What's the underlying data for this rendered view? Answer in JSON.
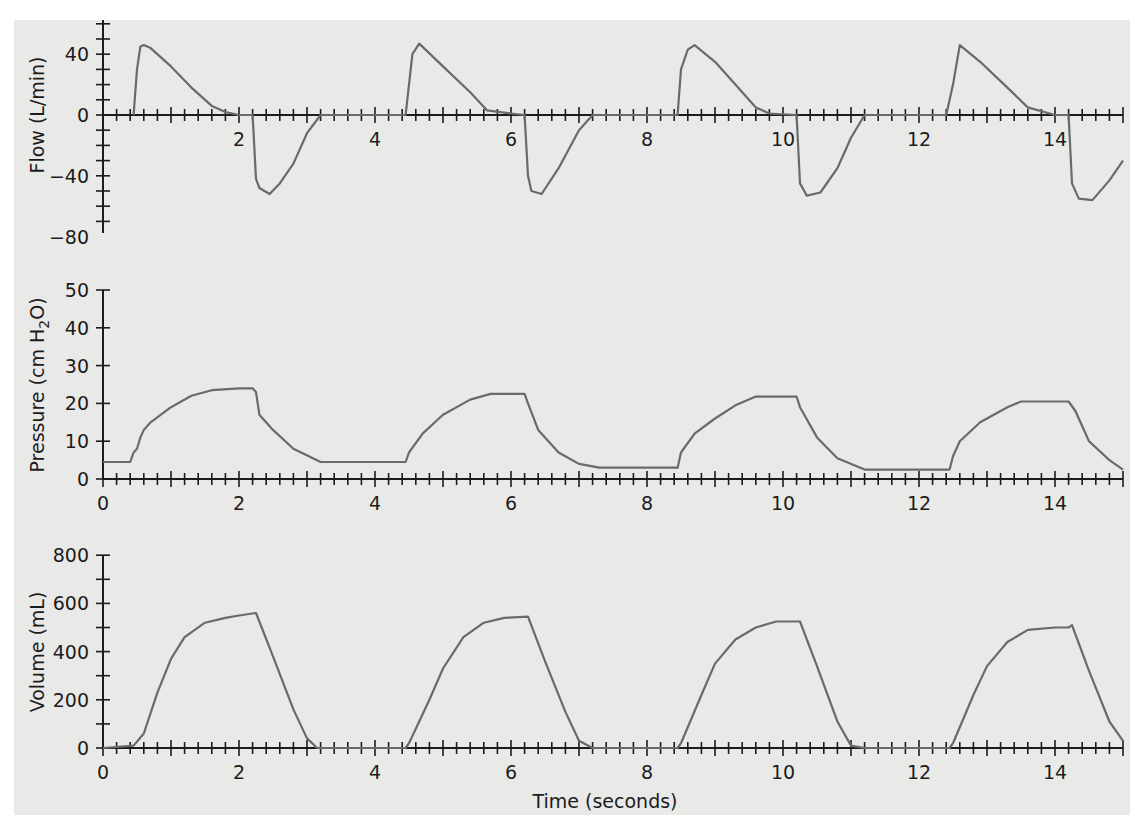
{
  "chart_data": [
    {
      "type": "line",
      "title": "",
      "xlabel": "",
      "ylabel": "Flow (L/min)",
      "ylim": [
        -80,
        60
      ],
      "xlim": [
        0,
        15
      ],
      "yticks": [
        40,
        0,
        -40,
        -80
      ],
      "xticks": [
        2,
        4,
        6,
        8,
        10,
        12,
        14
      ],
      "grid": false,
      "series": [
        {
          "name": "Flow",
          "x": [
            0.45,
            0.5,
            0.55,
            0.6,
            0.7,
            1.0,
            1.3,
            1.6,
            1.8,
            2.0,
            2.2,
            2.25,
            2.3,
            2.45,
            2.6,
            2.8,
            3.0,
            3.2,
            4.45,
            4.55,
            4.65,
            5.0,
            5.4,
            5.65,
            6.0,
            6.2,
            6.25,
            6.3,
            6.45,
            6.7,
            7.0,
            7.2,
            8.45,
            8.5,
            8.6,
            8.7,
            9.0,
            9.3,
            9.6,
            9.8,
            10.2,
            10.25,
            10.35,
            10.55,
            10.8,
            11.0,
            11.2,
            12.4,
            12.5,
            12.6,
            12.9,
            13.3,
            13.6,
            14.0,
            14.2,
            14.25,
            14.35,
            14.55,
            14.8,
            15.0
          ],
          "y": [
            0,
            30,
            45,
            46,
            44,
            32,
            18,
            6,
            2,
            0,
            0,
            -42,
            -48,
            -52,
            -45,
            -32,
            -12,
            0,
            0,
            40,
            47,
            32,
            15,
            3,
            1,
            0,
            -40,
            -50,
            -52,
            -35,
            -10,
            0,
            0,
            30,
            43,
            46,
            35,
            20,
            5,
            1,
            0,
            -45,
            -53,
            -51,
            -35,
            -15,
            0,
            0,
            20,
            46,
            35,
            18,
            5,
            0,
            0,
            -45,
            -55,
            -56,
            -43,
            -30
          ]
        }
      ]
    },
    {
      "type": "line",
      "title": "",
      "xlabel": "",
      "ylabel": "Pressure (cm H2O)",
      "ylim": [
        0,
        50
      ],
      "xlim": [
        0,
        15
      ],
      "yticks": [
        0,
        10,
        20,
        30,
        40,
        50
      ],
      "xticks": [
        0,
        2,
        4,
        6,
        8,
        10,
        12,
        14
      ],
      "grid": false,
      "series": [
        {
          "name": "Pressure",
          "x": [
            0,
            0.4,
            0.45,
            0.5,
            0.55,
            0.6,
            0.7,
            1.0,
            1.3,
            1.6,
            2.0,
            2.2,
            2.25,
            2.3,
            2.5,
            2.8,
            3.2,
            4.45,
            4.5,
            4.7,
            5.0,
            5.4,
            5.7,
            6.2,
            6.25,
            6.4,
            6.7,
            7.0,
            7.3,
            8.45,
            8.5,
            8.7,
            9.0,
            9.3,
            9.6,
            10.2,
            10.25,
            10.5,
            10.8,
            11.2,
            12.45,
            12.5,
            12.6,
            12.9,
            13.3,
            13.5,
            14.2,
            14.3,
            14.5,
            14.8,
            15.0
          ],
          "y": [
            4.5,
            4.5,
            7,
            8,
            11,
            13,
            15,
            19,
            22,
            23.5,
            24,
            24,
            23,
            17,
            13,
            8,
            4.5,
            4.5,
            7,
            12,
            17,
            21,
            22.5,
            22.5,
            20,
            13,
            7,
            4,
            3,
            3,
            7,
            12,
            16,
            19.5,
            21.8,
            21.8,
            19,
            11,
            5.5,
            2.5,
            2.5,
            6,
            10,
            15,
            19,
            20.5,
            20.5,
            18,
            10,
            5,
            2.5
          ]
        }
      ]
    },
    {
      "type": "line",
      "title": "",
      "xlabel": "Time (seconds)",
      "ylabel": "Volume (mL)",
      "ylim": [
        0,
        800
      ],
      "xlim": [
        0,
        15
      ],
      "yticks": [
        0,
        200,
        400,
        600,
        800
      ],
      "xticks": [
        0,
        2,
        4,
        6,
        8,
        10,
        12,
        14
      ],
      "grid": false,
      "series": [
        {
          "name": "Volume",
          "x": [
            0,
            0.45,
            0.6,
            0.8,
            1.0,
            1.2,
            1.5,
            1.8,
            2.0,
            2.25,
            2.5,
            2.8,
            3.0,
            3.15,
            4.45,
            4.5,
            4.8,
            5.0,
            5.3,
            5.6,
            5.9,
            6.25,
            6.5,
            6.8,
            7.0,
            7.2,
            8.45,
            8.5,
            8.8,
            9.0,
            9.3,
            9.6,
            9.9,
            10.25,
            10.5,
            10.8,
            11.0,
            11.2,
            12.45,
            12.5,
            12.8,
            13.0,
            13.3,
            13.6,
            14.0,
            14.2,
            14.25,
            14.5,
            14.8,
            15.0
          ],
          "y": [
            0,
            10,
            60,
            230,
            370,
            460,
            520,
            540,
            550,
            560,
            380,
            160,
            40,
            0,
            0,
            20,
            200,
            330,
            460,
            520,
            540,
            545,
            360,
            150,
            30,
            0,
            0,
            20,
            220,
            350,
            450,
            500,
            525,
            525,
            340,
            110,
            10,
            0,
            0,
            20,
            220,
            340,
            440,
            490,
            500,
            500,
            510,
            320,
            110,
            30
          ]
        }
      ]
    }
  ],
  "labels": {
    "flow_ylabel": "Flow (L/min)",
    "pressure_ylabel_main": "Pressure (cm H",
    "pressure_ylabel_sub": "2",
    "pressure_ylabel_end": "O)",
    "volume_ylabel": "Volume (mL)",
    "xlabel": "Time (seconds)"
  }
}
